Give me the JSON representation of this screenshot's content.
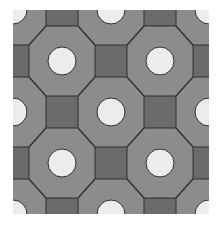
{
  "pattern": {
    "type": "octagon-and-square tiling with circles",
    "bounds": {
      "x": 13,
      "y": 10,
      "width": 196,
      "height": 204
    },
    "grid": {
      "origin_x": 13,
      "origin_y": 10,
      "step_x": 49,
      "step_y": 51,
      "cols": 5,
      "rows": 5
    },
    "circle_radius": 14,
    "square_half_size": 16,
    "colors": {
      "page_background": "#ffffff",
      "tile_fill": "#8c8c8c",
      "square_fill": "#6b6b6b",
      "circle_fill": "#ececec",
      "line": "#2e2e2e"
    }
  }
}
